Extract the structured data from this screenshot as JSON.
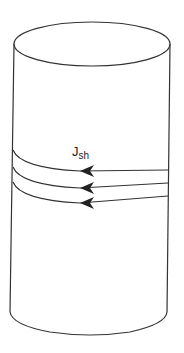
{
  "diagram": {
    "title": "",
    "shape": "cylinder",
    "current_label": {
      "main": "J",
      "subscript": "sh"
    },
    "loops": 3,
    "stroke_color": "#333333"
  }
}
